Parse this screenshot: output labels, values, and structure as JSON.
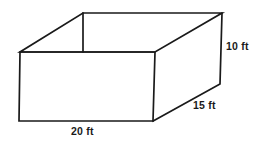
{
  "figure": {
    "shape_name": "rectangular-prism-open-top",
    "projection": "oblique",
    "background_color": "#ffffff",
    "line_color": "#1a1a1a",
    "text_color": "#1a1a1a"
  },
  "dimensions": {
    "height": {
      "label": "10 ft",
      "value": 10,
      "unit": "ft",
      "edge": "right-vertical"
    },
    "depth": {
      "label": "15 ft",
      "value": 15,
      "unit": "ft",
      "edge": "bottom-right-diagonal"
    },
    "width": {
      "label": "20 ft",
      "value": 20,
      "unit": "ft",
      "edge": "bottom-front-horizontal"
    }
  },
  "geometry": {
    "note": "Vertex pixel coordinates in the 261x144 image space",
    "vertices": {
      "back_top_left": [
        83,
        13
      ],
      "back_top_right": [
        222,
        13
      ],
      "front_top_left": [
        20,
        52
      ],
      "front_top_right": [
        155,
        52
      ],
      "front_bottom_left": [
        19,
        121
      ],
      "front_bottom_right": [
        153,
        121
      ],
      "right_bottom_back": [
        220,
        84
      ]
    },
    "paths": {
      "top_rim": "83,13 222,13 155,52 20,52 83,13",
      "front_face": "20,52 155,52 153,121 19,121 20,52",
      "right_face": "155,52 222,13 220,84 153,121",
      "inner_left_vertical": "83,13 83,52"
    }
  }
}
